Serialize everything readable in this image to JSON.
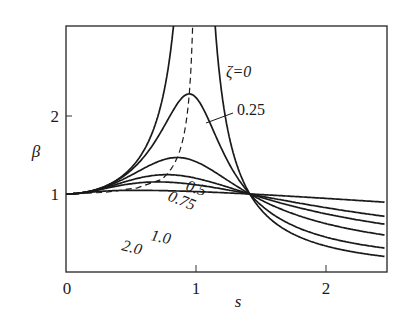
{
  "chart_data": {
    "type": "line",
    "title": "",
    "xlabel": "s",
    "ylabel": "β",
    "xlim": [
      0,
      2.45
    ],
    "ylim": [
      0,
      3.15
    ],
    "grid": false,
    "legend_position": "inline curve labels",
    "x_ticks": [
      "0",
      "1",
      "2"
    ],
    "y_ticks": [
      "1",
      "2"
    ],
    "formula": "β = sqrt((1+(2ζs)^2)/((1-s^2)^2+(2ζs)^2))",
    "series": [
      {
        "name": "ζ=0",
        "label": "ζ=0",
        "zeta": 0,
        "style": "solid",
        "points": [
          [
            0,
            1
          ],
          [
            0.5,
            1.33
          ],
          [
            0.7,
            1.96
          ],
          [
            0.8,
            2.78
          ],
          [
            1.2,
            2.27
          ],
          [
            1.5,
            0.8
          ],
          [
            2.0,
            0.33
          ],
          [
            2.45,
            0.2
          ]
        ]
      },
      {
        "name": "0.25",
        "label": "0.25",
        "zeta": 0.25,
        "style": "solid",
        "points": [
          [
            0,
            1
          ],
          [
            0.5,
            1.31
          ],
          [
            0.8,
            1.94
          ],
          [
            0.93,
            2.15
          ],
          [
            1.0,
            2.24
          ],
          [
            1.2,
            1.6
          ],
          [
            1.5,
            0.9
          ],
          [
            2.0,
            0.46
          ],
          [
            2.45,
            0.33
          ]
        ]
      },
      {
        "name": "0.5",
        "label": "0.5",
        "zeta": 0.5,
        "style": "solid",
        "points": [
          [
            0,
            1
          ],
          [
            0.5,
            1.24
          ],
          [
            0.8,
            1.46
          ],
          [
            1.0,
            1.41
          ],
          [
            1.5,
            0.88
          ],
          [
            2.0,
            0.6
          ],
          [
            2.45,
            0.48
          ]
        ]
      },
      {
        "name": "0.75",
        "label": "0.75",
        "zeta": 0.75,
        "style": "solid",
        "points": [
          [
            0,
            1
          ],
          [
            0.5,
            1.14
          ],
          [
            1.0,
            1.2
          ],
          [
            1.5,
            0.93
          ],
          [
            2.0,
            0.72
          ],
          [
            2.45,
            0.6
          ]
        ]
      },
      {
        "name": "1.0",
        "label": "1.0",
        "zeta": 1.0,
        "style": "solid",
        "points": [
          [
            0,
            1
          ],
          [
            0.5,
            1.09
          ],
          [
            1.0,
            1.12
          ],
          [
            1.5,
            0.98
          ],
          [
            2.0,
            0.82
          ],
          [
            2.45,
            0.72
          ]
        ]
      },
      {
        "name": "2.0",
        "label": "2.0",
        "zeta": 2.0,
        "style": "solid",
        "points": [
          [
            0,
            1
          ],
          [
            0.5,
            1.02
          ],
          [
            1.0,
            1.03
          ],
          [
            1.5,
            1.0
          ],
          [
            2.0,
            0.95
          ],
          [
            2.45,
            0.9
          ]
        ]
      },
      {
        "name": "peak locus",
        "label": "",
        "style": "dashed",
        "points": [
          [
            0,
            1
          ],
          [
            0.5,
            1.05
          ],
          [
            0.75,
            1.2
          ],
          [
            0.87,
            1.6
          ],
          [
            0.92,
            2.15
          ],
          [
            0.95,
            3.15
          ]
        ]
      }
    ]
  },
  "axes": {
    "xlabel": "s",
    "ylabel": "β",
    "xticks": [
      {
        "value": 0,
        "label": "0"
      },
      {
        "value": 1,
        "label": "1"
      },
      {
        "value": 2,
        "label": "2"
      }
    ],
    "yticks": [
      {
        "value": 1,
        "label": "1"
      },
      {
        "value": 2,
        "label": "2"
      }
    ]
  },
  "labels": {
    "z0": "ζ=0",
    "z025": "0.25",
    "z05": "0.5",
    "z075": "0.75",
    "z10": "1.0",
    "z20": "2.0"
  },
  "colors": {
    "line": "#1a1a1a",
    "frame": "#333333",
    "background": "#ffffff"
  }
}
